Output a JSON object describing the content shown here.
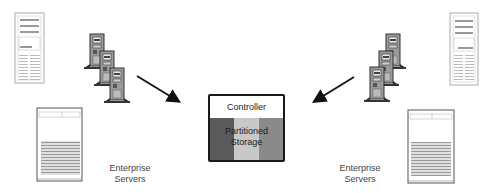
{
  "diagram": {
    "left_group": {
      "label_line1": "Enterprise",
      "label_line2": "Servers",
      "devices": [
        "tower-server-small",
        "tower-server-cluster-3",
        "tower-server-large"
      ]
    },
    "right_group": {
      "label_line1": "Enterprise",
      "label_line2": "Servers",
      "devices": [
        "tower-server-small",
        "tower-server-cluster-3",
        "tower-server-large"
      ]
    },
    "storage": {
      "controller_label": "Controller",
      "storage_label_line1": "Partitioned",
      "storage_label_line2": "Storage",
      "partition_colors": [
        "#5a5a5a",
        "#c8c8c8",
        "#8a8a8a"
      ]
    },
    "arrows": [
      {
        "from": "left-servers",
        "to": "storage"
      },
      {
        "from": "right-servers",
        "to": "storage"
      }
    ]
  }
}
